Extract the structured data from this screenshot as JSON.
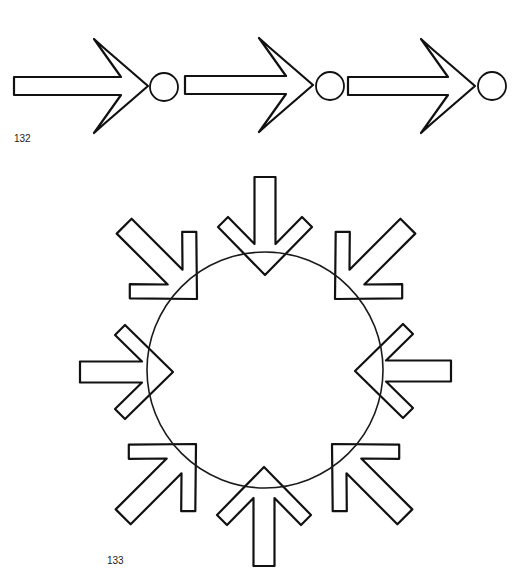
{
  "colors": {
    "stroke": "#111111",
    "background": "#ffffff"
  },
  "figure_132": {
    "label": "132",
    "label_pos": [
      14,
      134
    ],
    "description": "Three horizontal arrows in sequence, each pointing to a small circle",
    "shaft_half_width": 9,
    "head": {
      "notch_back": 27,
      "outer_near_back": 44,
      "outer_near_lat": 38,
      "outer_far_back": 54,
      "outer_far_lat": 47
    },
    "arrows": [
      {
        "name": "arrow-1",
        "tip": [
          148,
          86
        ],
        "angle": 0,
        "length": 134
      },
      {
        "name": "arrow-2",
        "tip": [
          313,
          85
        ],
        "angle": 0,
        "length": 128
      },
      {
        "name": "arrow-3",
        "tip": [
          475,
          86
        ],
        "angle": 0,
        "length": 127
      }
    ],
    "circles": [
      {
        "name": "node-circle-1",
        "cx": 164,
        "cy": 87,
        "r": 14
      },
      {
        "name": "node-circle-2",
        "cx": 330,
        "cy": 86,
        "r": 14
      },
      {
        "name": "node-circle-3",
        "cx": 492,
        "cy": 86,
        "r": 14
      }
    ]
  },
  "figure_133": {
    "label": "133",
    "label_pos": [
      107,
      556
    ],
    "description": "Eight arrows converging from all directions onto a large circle",
    "circle": {
      "cx": 265,
      "cy": 370,
      "r": 118
    },
    "shaft_half_width": 10.5,
    "head": {
      "notch_back": 31,
      "outer_near_back": 48,
      "outer_near_lat": 47,
      "outer_far_back": 58,
      "outer_far_lat": 37
    },
    "arrows": [
      {
        "name": "arrow-top",
        "tip": [
          265,
          275
        ],
        "angle": 90,
        "length": 98
      },
      {
        "name": "arrow-top-right",
        "tip": [
          335,
          299
        ],
        "angle": 135,
        "length": 103
      },
      {
        "name": "arrow-right",
        "tip": [
          355,
          371
        ],
        "angle": 180,
        "length": 96
      },
      {
        "name": "arrow-bottom-right",
        "tip": [
          332,
          444
        ],
        "angle": 225,
        "length": 103
      },
      {
        "name": "arrow-bottom",
        "tip": [
          264,
          467
        ],
        "angle": 270,
        "length": 99
      },
      {
        "name": "arrow-bottom-left",
        "tip": [
          196,
          444
        ],
        "angle": 315,
        "length": 103
      },
      {
        "name": "arrow-left",
        "tip": [
          173,
          372
        ],
        "angle": 0,
        "length": 93
      },
      {
        "name": "arrow-top-left",
        "tip": [
          197,
          299
        ],
        "angle": 45,
        "length": 103
      }
    ]
  }
}
